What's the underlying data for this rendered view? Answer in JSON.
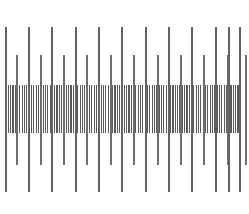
{
  "figure": {
    "name": "ruler-scale-diagram",
    "width": 249,
    "height": 214,
    "background_color": "#ffffff"
  },
  "chart_data": {
    "type": "bar",
    "title": "",
    "subtitle": "",
    "xlabel": "",
    "ylabel": "",
    "grid": false,
    "legend": null,
    "axis_ranges": {
      "x": [
        0,
        249
      ],
      "y": [
        0,
        214
      ]
    },
    "orientation": "vertical-ticks",
    "center_y": 109.5,
    "series": [
      {
        "name": "major-ticks",
        "level": 1,
        "count": 12,
        "color": "#636363",
        "line_width": 1.6,
        "y_top": 27,
        "y_bottom": 192,
        "length": 165,
        "spacing": 21.3,
        "x": [
          6,
          29,
          52,
          76,
          99,
          122,
          146,
          169,
          192,
          216,
          229,
          240
        ],
        "values": [
          165,
          165,
          165,
          165,
          165,
          165,
          165,
          165,
          165,
          165,
          165,
          165
        ]
      },
      {
        "name": "medium-ticks",
        "level": 2,
        "count": 21,
        "color": "#6e6e6e",
        "line_width": 1.4,
        "y_top": 55,
        "y_bottom": 165,
        "length": 110,
        "spacing": 11.7,
        "x": [
          17,
          29,
          41,
          52,
          64,
          76,
          87,
          99,
          111,
          122,
          134,
          146,
          158,
          169,
          181,
          192,
          204,
          216,
          228,
          240,
          246
        ],
        "values": [
          110,
          110,
          110,
          110,
          110,
          110,
          110,
          110,
          110,
          110,
          110,
          110,
          110,
          110,
          110,
          110,
          110,
          110,
          110,
          110,
          110
        ]
      },
      {
        "name": "minor-ticks",
        "level": 3,
        "count": 102,
        "color": "#5a5a5a",
        "line_width": 1.1,
        "y_top": 85,
        "y_bottom": 133,
        "length": 48,
        "spacing": 2.32,
        "x_start": 6,
        "x_end": 241,
        "values_uniform": 48
      }
    ],
    "notes": [
      "Monochrome gray tick marks on a white field",
      "All ticks are centered about the same horizontal midline",
      "Tick length encodes hierarchy: longest = major, shortest = minor",
      "The dense minor-tick band forms a solid gray horizontal stripe"
    ]
  },
  "colors": {
    "background": "#ffffff",
    "major_tick": "#636363",
    "medium_tick": "#6e6e6e",
    "minor_tick": "#5a5a5a"
  }
}
